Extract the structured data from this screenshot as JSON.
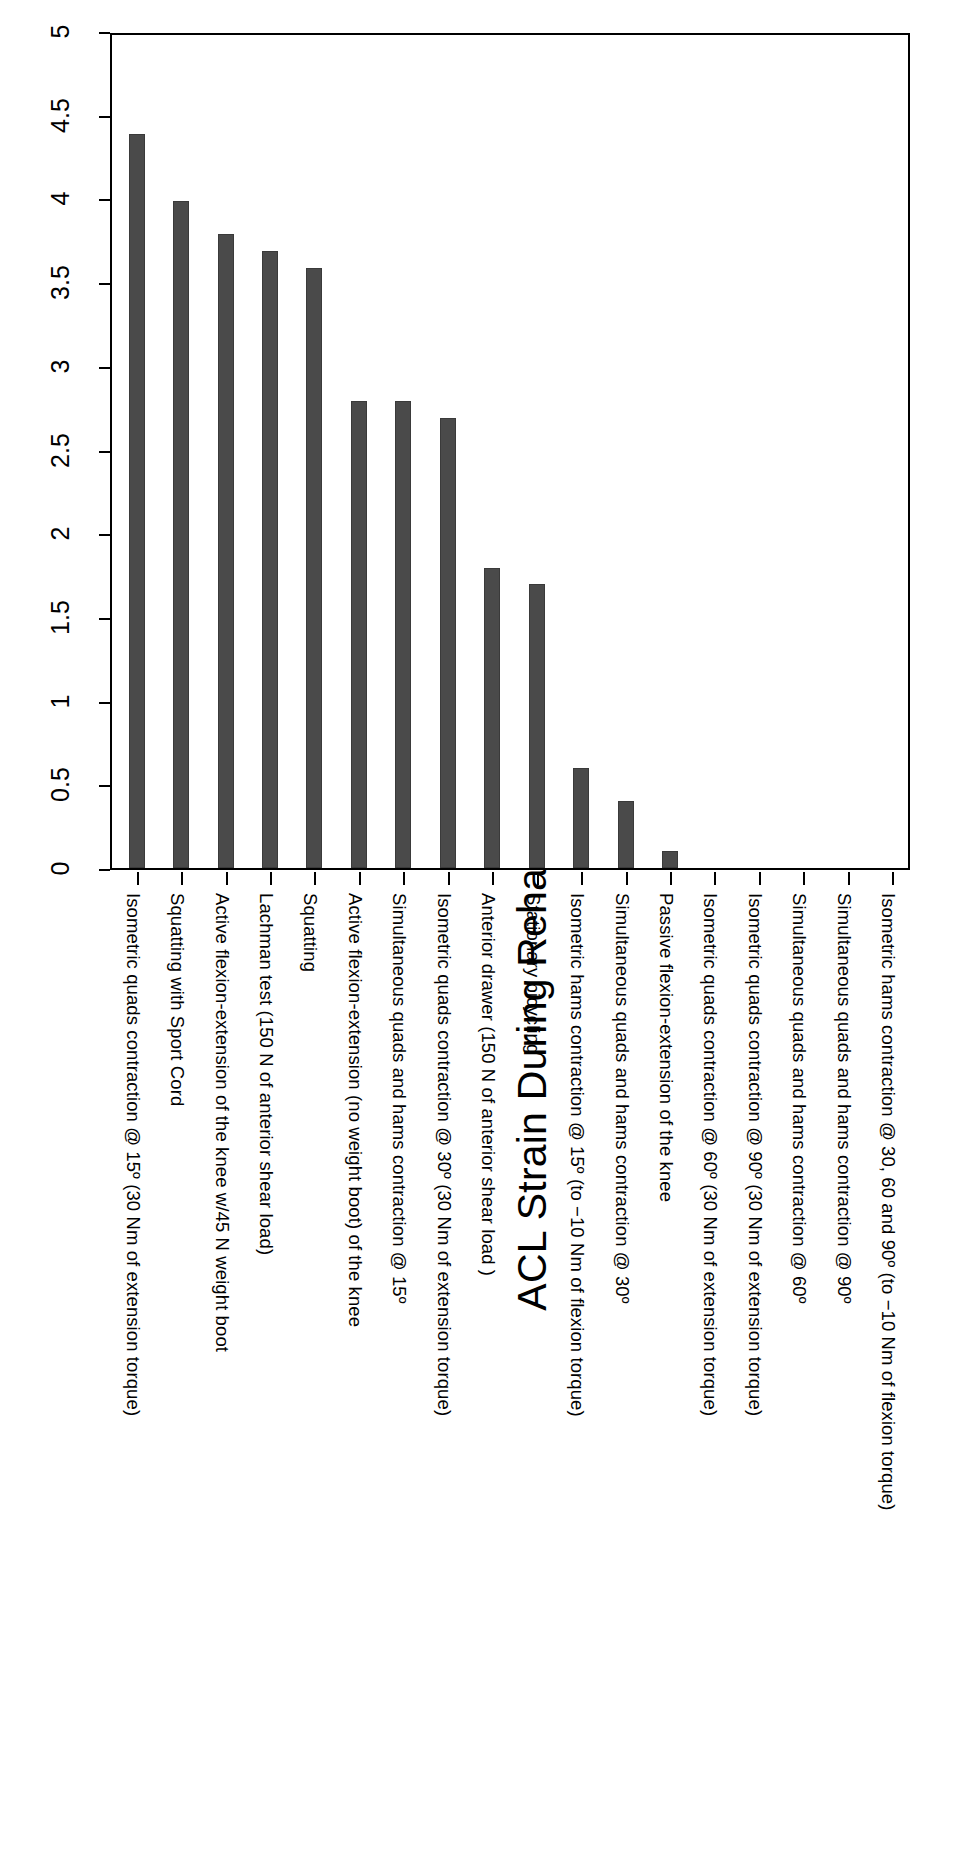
{
  "chart_data": {
    "type": "bar",
    "title": "ACL Strain During Rehabilitation Activities",
    "xlabel": "",
    "ylabel": "",
    "ylim": [
      0,
      5
    ],
    "yticks": [
      "0",
      "0.5",
      "1",
      "1.5",
      "2",
      "2.5",
      "3",
      "3.5",
      "4",
      "4.5",
      "5"
    ],
    "grid": false,
    "legend": "none",
    "orientation": "vertical-bars-rotated-page",
    "categories": [
      "Isometric quads contraction @ 15º (30 Nm of extension torque)",
      "Squatting with Sport Cord",
      "Active flexion-extension of the knee w/45 N weight boot",
      "Lachman test (150 N of anterior shear load)",
      "Squatting",
      "Active flexion-extension (no weight boot) of the knee",
      "Simultaneous quads and hams contraction @ 15º",
      "Isometric quads contraction @ 30º (30 Nm of extension torque)",
      "Anterior drawer (150 N of anterior shear load )",
      "Stationary bicycling",
      "Isometric hams contraction @ 15º (to −10 Nm of flexion torque)",
      "Simultaneous quads and hams contraction @ 30º",
      "Passive flexion-extension of the knee",
      "Isometric quads contraction @ 60º (30 Nm of extension torque)",
      "Isometric quads contraction @ 90º (30 Nm of extension torque)",
      "Simultaneous quads and hams contraction @ 60º",
      "Simultaneous quads and hams contraction @ 90º",
      "Isometric hams contraction @ 30, 60 and 90º (to −10 Nm of flexion torque)"
    ],
    "values": [
      4.4,
      4.0,
      3.8,
      3.7,
      3.6,
      2.8,
      2.8,
      2.7,
      1.8,
      1.7,
      0.6,
      0.4,
      0.1,
      0,
      0,
      0,
      0,
      0
    ],
    "bar_color": "#4a4a4a",
    "axis_color": "#000000"
  }
}
